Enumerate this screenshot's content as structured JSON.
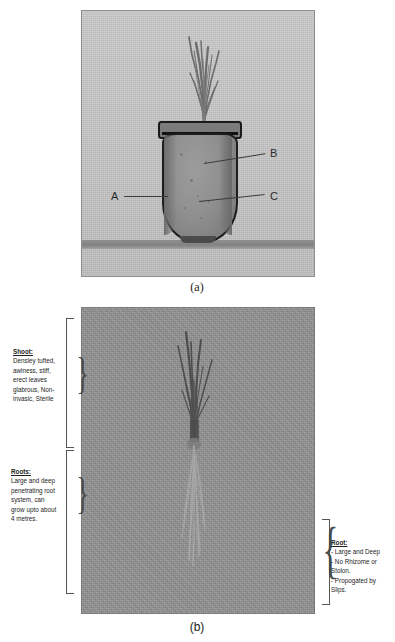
{
  "figure": {
    "panel_a": {
      "caption": "(a)",
      "labels": [
        {
          "id": "A",
          "text": "A"
        },
        {
          "id": "B",
          "text": "B"
        },
        {
          "id": "C",
          "text": "C"
        }
      ]
    },
    "panel_b": {
      "caption": "(b)",
      "annotations": {
        "shoot": {
          "header": "Shoot:",
          "lines": [
            "Densley tufted,",
            "awlness, stiff,",
            "erect leaves",
            "glabrous, Non-",
            "invasic, Sterile"
          ]
        },
        "roots": {
          "header": "Roots:",
          "lines": [
            "Large and deep",
            "penetrating root",
            "system, can",
            "grow upto about",
            "4 metres."
          ]
        },
        "root_right": {
          "header": "Root:",
          "lines": [
            "- Large and Deep",
            "- No Rhizome or",
            "Stolon.",
            "- Propogated by",
            "Slips."
          ]
        }
      }
    }
  },
  "colors": {
    "panel_a_background": "#c6c6c6",
    "panel_b_background": "#8e8e8e",
    "pot_fill": "#909090",
    "pot_outline": "#1d1d1d",
    "ground": "#8f8f8f",
    "text": "#1d1d1d",
    "leader_line": "#3a3a3a"
  }
}
